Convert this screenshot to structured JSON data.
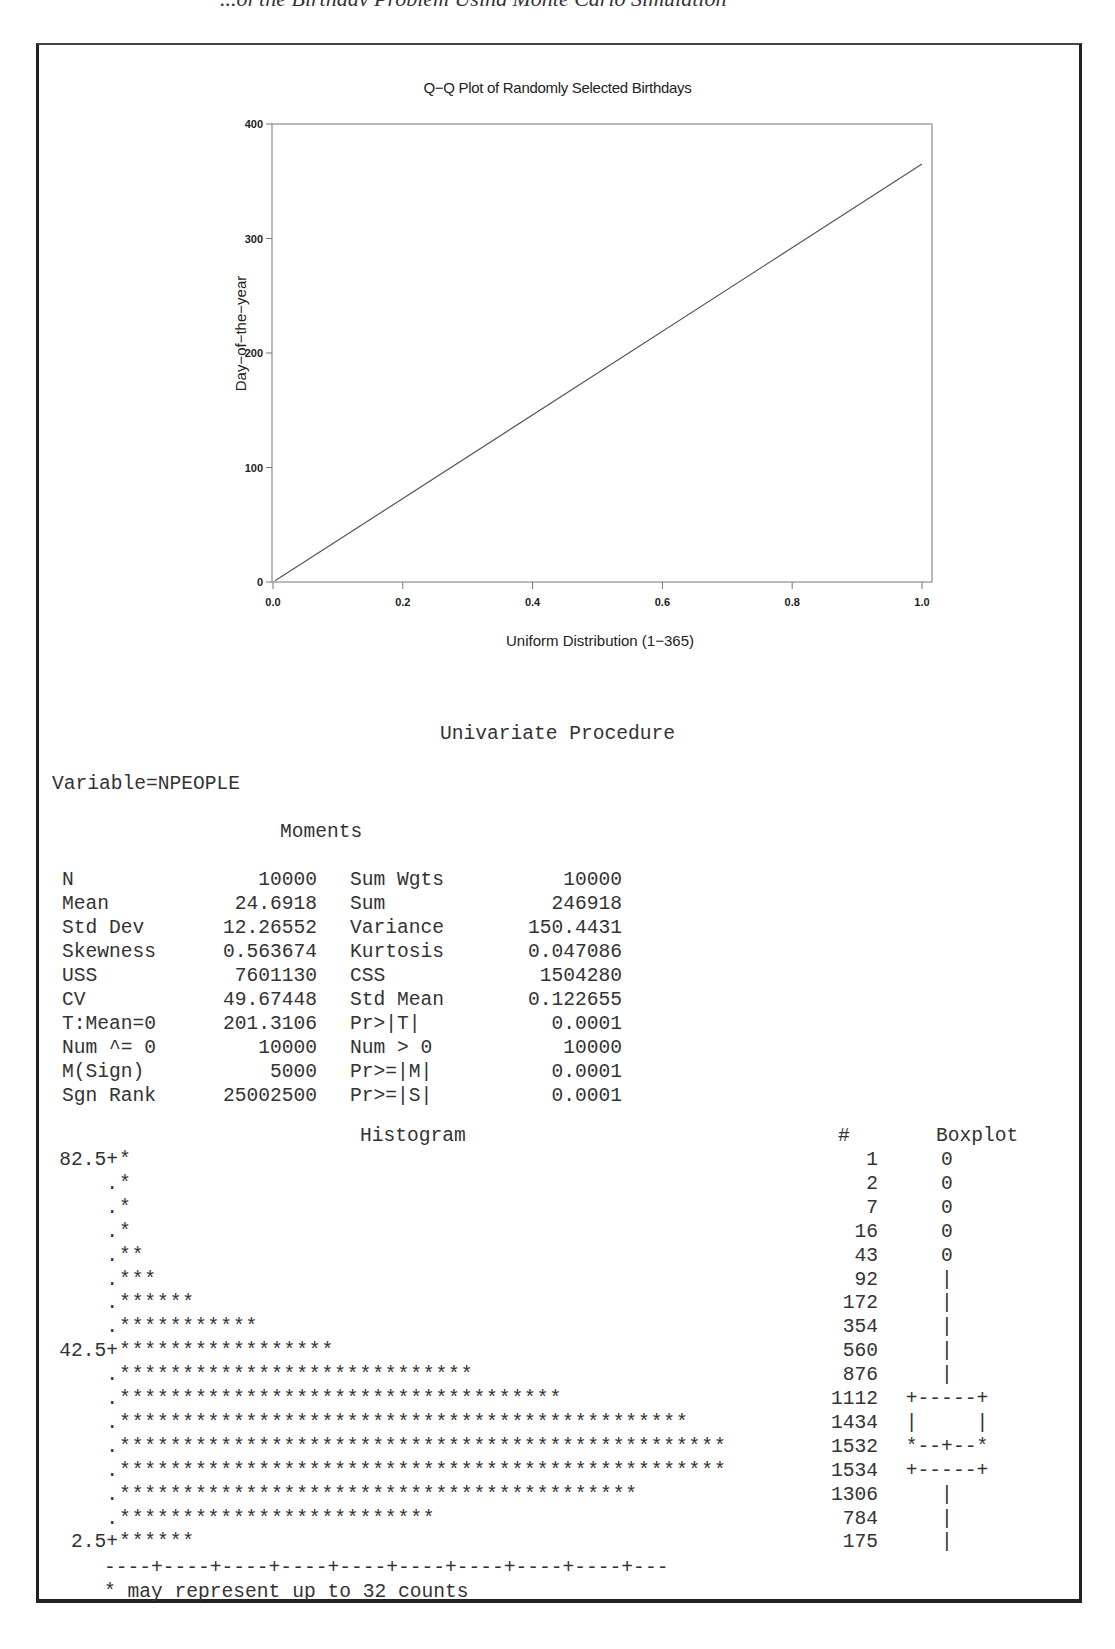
{
  "page_header_fragment": "...of the Birthday Problem Using Monte Carlo Simulation",
  "qq_plot": {
    "title": "Q−Q Plot of Randomly Selected Birthdays",
    "xlabel": "Uniform Distribution (1−365)",
    "ylabel": "Day−of−the−year",
    "x_ticks": [
      "0.0",
      "0.2",
      "0.4",
      "0.6",
      "0.8",
      "1.0"
    ],
    "y_ticks": [
      "0",
      "100",
      "200",
      "300",
      "400"
    ]
  },
  "chart_data": {
    "type": "line",
    "xlabel": "Uniform Distribution (1-365)",
    "ylabel": "Day-of-the-year",
    "x": [
      0.0,
      0.2,
      0.4,
      0.6,
      0.8,
      1.0
    ],
    "series": [
      {
        "name": "Birthday quantiles",
        "values": [
          1,
          73.8,
          146.6,
          219.4,
          292.2,
          365
        ]
      }
    ],
    "xlim": [
      0.0,
      1.0
    ],
    "ylim": [
      0,
      400
    ],
    "x_tick_labels": [
      "0.0",
      "0.2",
      "0.4",
      "0.6",
      "0.8",
      "1.0"
    ],
    "y_tick_labels": [
      "0",
      "100",
      "200",
      "300",
      "400"
    ],
    "grid": false,
    "legend": "none"
  },
  "univariate": {
    "title": "Univariate Procedure",
    "variable": "Variable=NPEOPLE",
    "moments_title": "Moments",
    "moments": [
      {
        "label1": "N",
        "value1": "10000",
        "label2": "Sum Wgts",
        "value2": "10000"
      },
      {
        "label1": "Mean",
        "value1": "24.6918",
        "label2": "Sum",
        "value2": "246918"
      },
      {
        "label1": "Std Dev",
        "value1": "12.26552",
        "label2": "Variance",
        "value2": "150.4431"
      },
      {
        "label1": "Skewness",
        "value1": "0.563674",
        "label2": "Kurtosis",
        "value2": "0.047086"
      },
      {
        "label1": "USS",
        "value1": "7601130",
        "label2": "CSS",
        "value2": "1504280"
      },
      {
        "label1": "CV",
        "value1": "49.67448",
        "label2": "Std Mean",
        "value2": "0.122655"
      },
      {
        "label1": "T:Mean=0",
        "value1": "201.3106",
        "label2": "Pr>|T|",
        "value2": "0.0001"
      },
      {
        "label1": "Num ^= 0",
        "value1": "10000",
        "label2": "Num > 0",
        "value2": "10000"
      },
      {
        "label1": "M(Sign)",
        "value1": "5000",
        "label2": "Pr>=|M|",
        "value2": "0.0001"
      },
      {
        "label1": "Sgn Rank",
        "value1": "25002500",
        "label2": "Pr>=|S|",
        "value2": "0.0001"
      }
    ]
  },
  "histogram": {
    "title": "Histogram",
    "count_header": "#",
    "boxplot_header": "Boxplot",
    "rows": [
      {
        "axis": "82.5+",
        "bars": "*",
        "count": "1",
        "box": "0"
      },
      {
        "axis": ".",
        "bars": "*",
        "count": "2",
        "box": "0"
      },
      {
        "axis": ".",
        "bars": "*",
        "count": "7",
        "box": "0"
      },
      {
        "axis": ".",
        "bars": "*",
        "count": "16",
        "box": "0"
      },
      {
        "axis": ".",
        "bars": "**",
        "count": "43",
        "box": "0"
      },
      {
        "axis": ".",
        "bars": "***",
        "count": "92",
        "box": "|"
      },
      {
        "axis": ".",
        "bars": "******",
        "count": "172",
        "box": "|"
      },
      {
        "axis": ".",
        "bars": "***********",
        "count": "354",
        "box": "|"
      },
      {
        "axis": "42.5+",
        "bars": "*****************",
        "count": "560",
        "box": "|"
      },
      {
        "axis": ".",
        "bars": "****************************",
        "count": "876",
        "box": "|"
      },
      {
        "axis": ".",
        "bars": "***********************************",
        "count": "1112",
        "box": "+-----+"
      },
      {
        "axis": ".",
        "bars": "*********************************************",
        "count": "1434",
        "box": "|     |"
      },
      {
        "axis": ".",
        "bars": "************************************************",
        "count": "1532",
        "box": "*--+--*"
      },
      {
        "axis": ".",
        "bars": "************************************************",
        "count": "1534",
        "box": "+-----+"
      },
      {
        "axis": ".",
        "bars": "*****************************************",
        "count": "1306",
        "box": "|"
      },
      {
        "axis": ".",
        "bars": "*************************",
        "count": "784",
        "box": "|"
      },
      {
        "axis": "2.5+",
        "bars": "******",
        "count": "175",
        "box": "|"
      }
    ],
    "x_axis": "----+----+----+----+----+----+----+----+----+---",
    "footnote": "* may represent up to 32 counts"
  }
}
